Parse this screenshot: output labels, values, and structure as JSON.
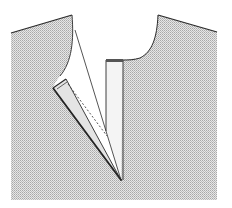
{
  "diagram": {
    "title": "",
    "colors": {
      "background": "#ffffff",
      "fabric": "#d6d6d6",
      "outline": "#2a2a2a",
      "placket": "#e2e2e2"
    },
    "parts": [
      {
        "id": "left-bodice",
        "label": ""
      },
      {
        "id": "right-bodice",
        "label": ""
      },
      {
        "id": "right-placket",
        "label": ""
      },
      {
        "id": "left-placket-folded",
        "label": ""
      },
      {
        "id": "slit-line",
        "label": ""
      },
      {
        "id": "stitch-line",
        "label": ""
      }
    ]
  }
}
